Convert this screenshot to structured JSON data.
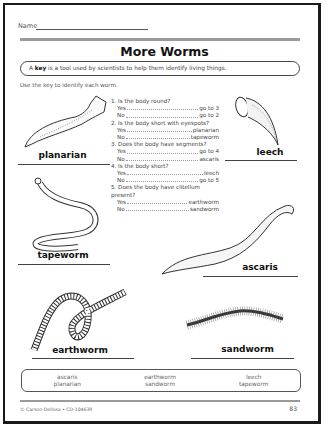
{
  "worksheet": {
    "name_label": "Name",
    "title": "More Worms",
    "key_definition": {
      "prefix": "A ",
      "bold": "key",
      "suffix": " is a tool used by scientists to help them identify living things."
    },
    "instructions": "Use the key to identify each worm.",
    "key_steps": [
      {
        "question": "1. Is the body round?",
        "yes": "go to 3",
        "no": "go to 2"
      },
      {
        "question": "2. Is the body short with eyespots?",
        "yes": "planarian",
        "no": "tapeworm"
      },
      {
        "question": "3. Does the body have segments?",
        "yes": "go to 4",
        "no": "ascaris"
      },
      {
        "question": "4. Is the body short?",
        "yes": "leech",
        "no": "go to 5"
      },
      {
        "question": "5. Does the body have clitellum present?",
        "yes": "earthworm",
        "no": "sandworm"
      }
    ],
    "yes_label": "Yes",
    "no_label": "No",
    "worm_labels": {
      "planarian": "planarian",
      "leech": "leech",
      "tapeworm": "tapeworm",
      "ascaris": "ascaris",
      "earthworm": "earthworm",
      "sandworm": "sandworm"
    },
    "word_bank": [
      [
        "ascaris",
        "planarian"
      ],
      [
        "earthworm",
        "sandworm"
      ],
      [
        "leech",
        "tapeworm"
      ]
    ],
    "footer": "© Carson-Dellosa • CD-104639",
    "page_number": "83"
  }
}
